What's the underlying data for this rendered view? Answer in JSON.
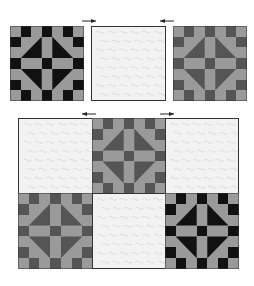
{
  "diagram": {
    "title": "",
    "palette": {
      "dark_black": "#111111",
      "dark_grey": "#555555",
      "light_grey": "#9a9a9a",
      "plain_fabric": "#f2f2f2",
      "outline": "#333333",
      "arrow": "#222222"
    },
    "top_row": {
      "label": "single row",
      "blocks": [
        {
          "type": "pieced",
          "variant": "black"
        },
        {
          "type": "plain"
        },
        {
          "type": "pieced",
          "variant": "grey"
        }
      ],
      "arrows": [
        {
          "direction": "right",
          "between": "block-1 and block-2"
        },
        {
          "direction": "left",
          "between": "block-2 and block-3"
        }
      ]
    },
    "bottom_grid": {
      "rows": [
        [
          {
            "type": "plain"
          },
          {
            "type": "pieced",
            "variant": "grey"
          },
          {
            "type": "plain"
          }
        ],
        [
          {
            "type": "pieced",
            "variant": "grey"
          },
          {
            "type": "plain"
          },
          {
            "type": "pieced",
            "variant": "black"
          }
        ]
      ],
      "arrows": [
        {
          "direction": "left",
          "between": "column-1 and column-2"
        },
        {
          "direction": "right",
          "between": "column-2 and column-3"
        }
      ]
    }
  }
}
